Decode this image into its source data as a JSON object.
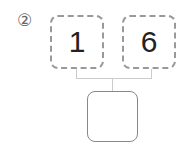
{
  "problem": {
    "label": "②",
    "boxes": [
      {
        "value": "1"
      },
      {
        "value": "6"
      }
    ],
    "result_box": {
      "value": ""
    }
  }
}
